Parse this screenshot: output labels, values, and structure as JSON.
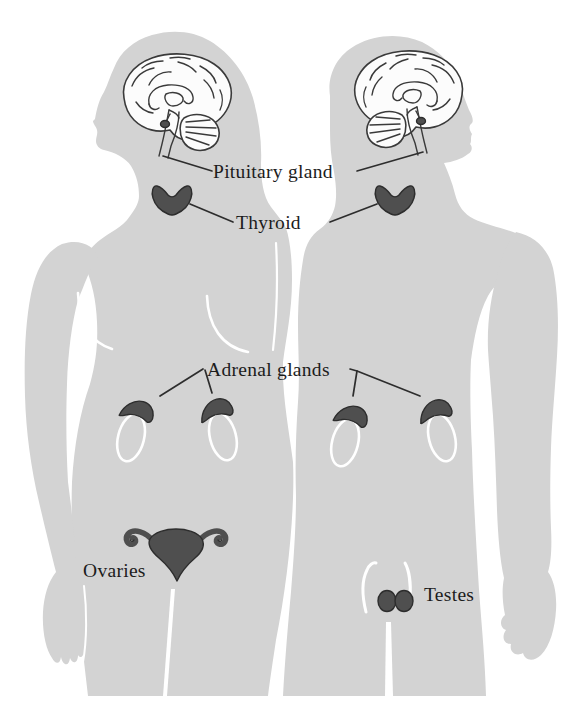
{
  "diagram": {
    "figures": [
      {
        "name": "female silhouette",
        "position": "left",
        "glands_shown": [
          "Pituitary gland",
          "Thyroid",
          "Adrenal glands",
          "Ovaries"
        ]
      },
      {
        "name": "male silhouette",
        "position": "right",
        "glands_shown": [
          "Pituitary gland",
          "Thyroid",
          "Adrenal glands",
          "Testes"
        ]
      }
    ]
  },
  "labels": {
    "pituitary": "Pituitary gland",
    "thyroid": "Thyroid",
    "adrenal": "Adrenal glands",
    "ovaries": "Ovaries",
    "testes": "Testes"
  },
  "colors": {
    "background": "#ffffff",
    "body_silhouette": "#d3d3d3",
    "gland_fill": "#4f4f4f",
    "gland_stroke": "#2d2d2d",
    "brain_line": "#3a3a3a",
    "brain_fill": "#fcfcfc",
    "label_text": "#1c1c1c",
    "leader_line": "#2d2d2d",
    "body_detail_line": "#ffffff"
  }
}
